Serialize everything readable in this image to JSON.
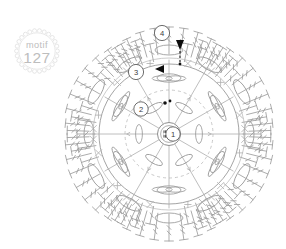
{
  "page": {
    "background_color": "#ffffff"
  },
  "badge": {
    "name": "motif-badge",
    "word": "motif",
    "number": "127",
    "text_color": "#bdbdbd",
    "border_color": "#d6d6d6",
    "style": "scalloped-circle"
  },
  "chart_legend": {
    "center_ring_label": "magic-ring",
    "start_marker_label": "start-arrow",
    "direction_marker_label": "direction-arrow"
  },
  "rounds": [
    {
      "id": "round-1",
      "label": "1",
      "cx": 121,
      "cy": 126,
      "r": 7.2
    },
    {
      "id": "round-2",
      "label": "2",
      "cx": 89,
      "cy": 101,
      "r": 7.2
    },
    {
      "id": "round-3",
      "label": "3",
      "cx": 84,
      "cy": 64,
      "r": 7.6
    },
    {
      "id": "round-4",
      "label": "4",
      "cx": 110,
      "cy": 25,
      "r": 7.6
    }
  ],
  "markers": [
    {
      "id": "start-marker",
      "label": "start-arrow",
      "color": "#0d0d0d",
      "x": 128,
      "y": 36
    },
    {
      "id": "round3-marker",
      "label": "direction-arrow",
      "color": "#0d0d0d",
      "x": 100,
      "y": 62
    },
    {
      "id": "round2-marker",
      "label": "join-dot",
      "color": "#0d0d0d",
      "x": 113,
      "y": 95
    }
  ],
  "chart_data": {
    "type": "diagram",
    "title": "motif 127",
    "subtype": "crochet-stitch-chart",
    "lobes": 6,
    "round_count": 4,
    "symbols": {
      "center": "magic-ring",
      "round_1": "chain-ring-with-double-crochet",
      "round_2": "petal-shells",
      "round_3": "treble-clusters",
      "round_4": "fan-of-trebles"
    },
    "stroke_color": "#9d9d9d",
    "accent_color": "#0d0d0d"
  }
}
